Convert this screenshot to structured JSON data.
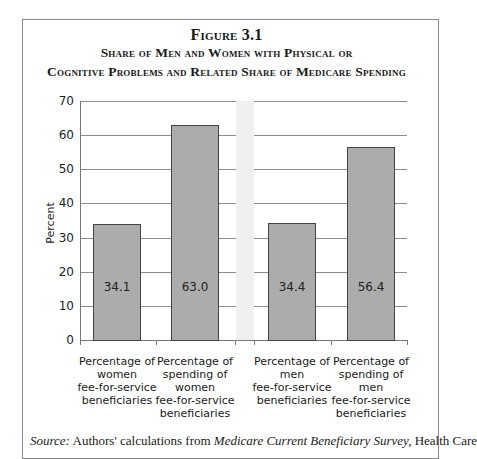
{
  "figure": {
    "number": "Figure 3.1",
    "title_line1": "Share of Men and Women with Physical or",
    "title_line2": "Cognitive Problems and Related Share of Medicare Spending"
  },
  "chart_data": {
    "type": "bar",
    "categories": [
      "Percentage of women fee-for-service beneficiaries",
      "Percentage of spending of women fee-for-service beneficiaries",
      "Percentage of men fee-for-service beneficiaries",
      "Percentage of spending of men fee-for-service beneficiaries"
    ],
    "values": [
      34.1,
      63.0,
      34.4,
      56.4
    ],
    "value_labels": [
      "34.1",
      "63.0",
      "34.4",
      "56.4"
    ],
    "xlabel": "",
    "ylabel": "Percent",
    "ylim": [
      0,
      70
    ],
    "yticks": [
      "0",
      "10",
      "20",
      "30",
      "40",
      "50",
      "60",
      "70"
    ],
    "grid": true,
    "legend": null,
    "bar_color": "#acacac"
  },
  "category_lines": [
    [
      "Percentage of",
      "women",
      "fee-for-service",
      "beneficiaries"
    ],
    [
      "Percentage of",
      "spending of",
      "women",
      "fee-for-service",
      "beneficiaries"
    ],
    [
      "Percentage of",
      "men",
      "fee-for-service",
      "beneficiaries"
    ],
    [
      "Percentage of",
      "spending of",
      "men",
      "fee-for-service",
      "beneficiaries"
    ]
  ],
  "source": {
    "label": "Source:",
    "text1": "Authors' calculations from",
    "italic": "Medicare Current Beneficiary Survey,",
    "text2": "Health Care"
  }
}
